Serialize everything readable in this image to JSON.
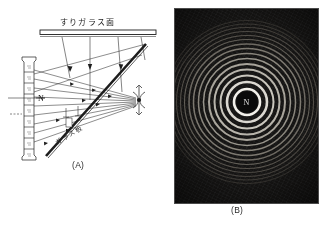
{
  "figure": {
    "panel_a": {
      "caption": "(A)",
      "ground_glass_label": "すりガラス面",
      "glass_plate_label": "ガラス板",
      "point_label": "N",
      "scale_strip_marks": [
        "明",
        "暗",
        "明",
        "暗",
        "明",
        "暗",
        "明",
        "暗",
        "明"
      ],
      "observer": "eye-symbol"
    },
    "panel_b": {
      "caption": "(B)",
      "center_label": "N",
      "description": "newtons-rings-photograph"
    }
  },
  "chart_data": {
    "type": "scatter",
    "ring_count": 15,
    "center": [
      0,
      0
    ],
    "ring_radii_px": [
      13,
      20,
      26.5,
      32.5,
      38,
      43.5,
      48.5,
      53.5,
      58,
      62.5,
      66.5,
      70.5,
      74.5,
      78,
      81.5
    ],
    "ring_colors": [
      "#f2f0ea",
      "#e6e3db",
      "#dcd8cf",
      "#d2cec4",
      "#c8c3b8",
      "#bdb8ad",
      "#b3aea2",
      "#a9a398",
      "#9e988d",
      "#948e83",
      "#8a8479",
      "#7f7a70",
      "#757066",
      "#6b665d",
      "#615d55"
    ],
    "background": "#0a0a0a",
    "grid": false,
    "legend": "none"
  },
  "colors": {
    "ink": "#1d1d1d",
    "paper": "#ffffff",
    "photo_bg": "#0a0a0a",
    "ring_bright": "#f2f0ea"
  }
}
